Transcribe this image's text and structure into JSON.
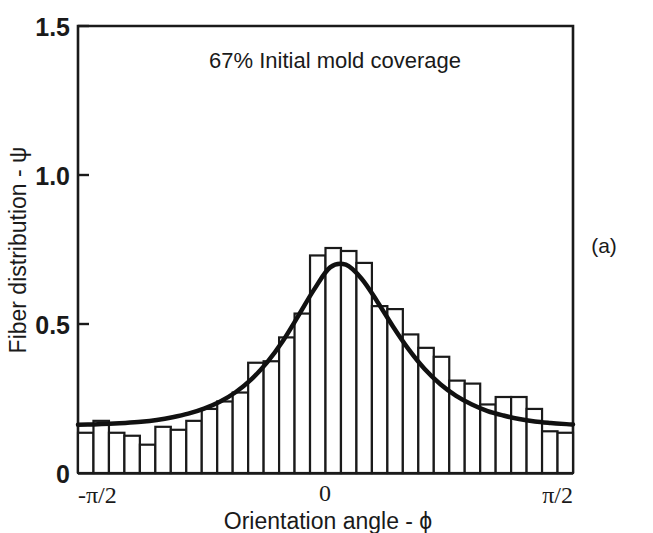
{
  "figure": {
    "panel_label": "(a)",
    "annotation": "67% Initial mold coverage"
  },
  "axes": {
    "x_title": "Orientation angle - ϕ",
    "y_title": "Fiber distribution - ψ",
    "x_ticks": [
      "-π/2",
      "0",
      "π/2"
    ],
    "y_ticks": [
      "0",
      "0.5",
      "1.0",
      "1.5"
    ]
  },
  "colors": {
    "ink": "#1a1a1a",
    "bar_fill": "#ffffff",
    "bar_stroke": "#1a1a1a",
    "curve": "#111111",
    "background": "#ffffff"
  },
  "chart_data": {
    "type": "bar",
    "title": "67% Initial mold coverage",
    "xlabel": "Orientation angle - ϕ",
    "ylabel": "Fiber distribution - ψ",
    "xlim": [
      -1.5707963,
      1.5707963
    ],
    "ylim": [
      0,
      1.5
    ],
    "xtick_values": [
      -1.5707963,
      0,
      1.5707963
    ],
    "xtick_labels": [
      "-π/2",
      "0",
      "π/2"
    ],
    "ytick_values": [
      0,
      0.5,
      1.0,
      1.5
    ],
    "ytick_labels": [
      "0",
      "0.5",
      "1.0",
      "1.5"
    ],
    "grid": false,
    "legend": false,
    "bin_count": 32,
    "bin_centers": [
      -1.5217,
      -1.4235,
      -1.3254,
      -1.2272,
      -1.129,
      -1.0308,
      -0.9327,
      -0.8345,
      -0.7363,
      -0.6381,
      -0.54,
      -0.4418,
      -0.3436,
      -0.2454,
      -0.1473,
      -0.0491,
      0.0491,
      0.1473,
      0.2454,
      0.3436,
      0.4418,
      0.54,
      0.6381,
      0.7363,
      0.8345,
      0.9327,
      1.0308,
      1.129,
      1.2272,
      1.3254,
      1.4235,
      1.5217
    ],
    "values": [
      0.135,
      0.175,
      0.135,
      0.125,
      0.095,
      0.155,
      0.145,
      0.175,
      0.215,
      0.24,
      0.27,
      0.37,
      0.375,
      0.455,
      0.535,
      0.73,
      0.755,
      0.745,
      0.705,
      0.56,
      0.55,
      0.465,
      0.42,
      0.39,
      0.31,
      0.3,
      0.23,
      0.255,
      0.255,
      0.215,
      0.14,
      0.135
    ],
    "series": [
      {
        "name": "Fiber orientation histogram",
        "type": "bar",
        "values": [
          0.135,
          0.175,
          0.135,
          0.125,
          0.095,
          0.155,
          0.145,
          0.175,
          0.215,
          0.24,
          0.27,
          0.37,
          0.375,
          0.455,
          0.535,
          0.73,
          0.755,
          0.745,
          0.705,
          0.56,
          0.55,
          0.465,
          0.42,
          0.39,
          0.31,
          0.3,
          0.23,
          0.255,
          0.255,
          0.215,
          0.14,
          0.135
        ]
      },
      {
        "name": "Predicted distribution",
        "type": "line",
        "x": [
          -1.5708,
          -1.4708,
          -1.3708,
          -1.2708,
          -1.1708,
          -1.0708,
          -0.9708,
          -0.8708,
          -0.7708,
          -0.6708,
          -0.5708,
          -0.4708,
          -0.3708,
          -0.2708,
          -0.1708,
          -0.0708,
          0.0292,
          0.1292,
          0.2292,
          0.3292,
          0.4292,
          0.5292,
          0.6292,
          0.7292,
          0.8292,
          0.9292,
          1.0292,
          1.1292,
          1.2292,
          1.3292,
          1.4292,
          1.5292,
          1.5708
        ],
        "y": [
          0.162,
          0.163,
          0.165,
          0.168,
          0.172,
          0.178,
          0.187,
          0.199,
          0.216,
          0.239,
          0.271,
          0.314,
          0.371,
          0.443,
          0.529,
          0.617,
          0.69,
          0.699,
          0.652,
          0.575,
          0.491,
          0.414,
          0.349,
          0.298,
          0.259,
          0.23,
          0.208,
          0.193,
          0.181,
          0.173,
          0.168,
          0.164,
          0.163
        ]
      }
    ]
  }
}
